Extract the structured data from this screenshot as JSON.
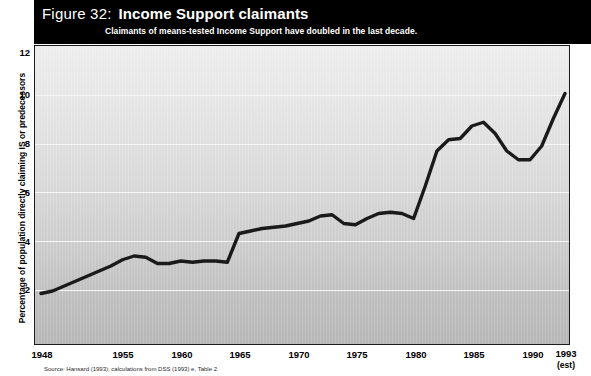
{
  "figure": {
    "number_label": "Figure 32:",
    "title": "Income Support claimants",
    "subtitle": "Claimants of means-tested Income Support have doubled in the last decade.",
    "source_note": "Source: Hansard (1993); calculations from DSS (1993) e, Table 2"
  },
  "colors": {
    "header_background": "#000000",
    "header_text": "#ffffff",
    "line": "#1a1a1a",
    "plot_top": "#ededed",
    "plot_bottom": "#b6b6b6",
    "gridline": "#f6f6f6",
    "axis_border": "#1a1a1a"
  },
  "axes": {
    "y_title": "Percentage of population directly claiming IS or predecessors",
    "y_ticks": [
      "12",
      "10",
      "8",
      "6",
      "4",
      "2"
    ],
    "x_ticks": [
      {
        "label": "1948",
        "sub": ""
      },
      {
        "label": "1955",
        "sub": ""
      },
      {
        "label": "1960",
        "sub": ""
      },
      {
        "label": "1965",
        "sub": ""
      },
      {
        "label": "1970",
        "sub": ""
      },
      {
        "label": "1975",
        "sub": ""
      },
      {
        "label": "1980",
        "sub": ""
      },
      {
        "label": "1985",
        "sub": ""
      },
      {
        "label": "1990",
        "sub": ""
      },
      {
        "label": "1993",
        "sub": "(est)"
      }
    ]
  },
  "chart_data": {
    "type": "line",
    "title": "Income Support claimants",
    "subtitle": "Claimants of means-tested Income Support have doubled in the last decade.",
    "xlabel": "",
    "ylabel": "Percentage of population directly claiming IS or predecessors",
    "xlim": [
      1948,
      1993
    ],
    "ylim": [
      0,
      12
    ],
    "y_tick_values": [
      2,
      4,
      6,
      8,
      10,
      12
    ],
    "x_tick_values": [
      1948,
      1955,
      1960,
      1965,
      1970,
      1975,
      1980,
      1985,
      1990,
      1993
    ],
    "grid": "horizontal",
    "legend": "none",
    "series": [
      {
        "name": "Percentage of population directly claiming IS or predecessors",
        "color": "#1a1a1a",
        "x": [
          1948,
          1949,
          1950,
          1951,
          1952,
          1953,
          1954,
          1955,
          1956,
          1957,
          1958,
          1959,
          1960,
          1961,
          1962,
          1963,
          1964,
          1965,
          1966,
          1967,
          1968,
          1969,
          1970,
          1971,
          1972,
          1973,
          1974,
          1975,
          1976,
          1977,
          1978,
          1979,
          1980,
          1981,
          1982,
          1983,
          1984,
          1985,
          1986,
          1987,
          1988,
          1989,
          1990,
          1991,
          1992,
          1993
        ],
        "values": [
          2.1,
          2.2,
          2.4,
          2.6,
          2.8,
          3.0,
          3.2,
          3.45,
          3.6,
          3.55,
          3.3,
          3.3,
          3.4,
          3.35,
          3.4,
          3.4,
          3.35,
          4.5,
          4.6,
          4.7,
          4.75,
          4.8,
          4.9,
          5.0,
          5.2,
          5.25,
          4.9,
          4.85,
          5.1,
          5.3,
          5.35,
          5.3,
          5.1,
          6.4,
          7.8,
          8.25,
          8.3,
          8.8,
          8.95,
          8.5,
          7.8,
          7.45,
          7.45,
          8.0,
          9.1,
          10.1
        ]
      }
    ],
    "annotations": []
  }
}
